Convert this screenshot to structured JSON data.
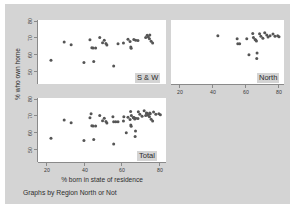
{
  "figure": {
    "caption": "Graphs by Region North or Not",
    "background_color": "#d4d4d4",
    "panel_background_color": "#ffffff",
    "marker_color": "#555555"
  },
  "axes": {
    "ylabel": "% who own home",
    "xlabel": "% born in state of residence",
    "yticks": [
      "80",
      "70",
      "60",
      "50"
    ],
    "xticks": [
      "20",
      "40",
      "60",
      "80"
    ],
    "ylim": [
      46,
      82
    ],
    "xlim": [
      17,
      85
    ]
  },
  "chart_data": {
    "type": "scatter",
    "title": "",
    "xlabel": "% born in state of residence",
    "ylabel": "% who own home",
    "xlim": [
      17,
      85
    ],
    "ylim": [
      46,
      82
    ],
    "xticks": [
      20,
      40,
      60,
      80
    ],
    "yticks": [
      50,
      60,
      70,
      80
    ],
    "grid": false,
    "legend": "panel-corner-labels",
    "panels": [
      {
        "name": "S & W",
        "label": "S & W",
        "position": "top-left",
        "x_axis_labels_shown": false,
        "y_axis_labels_shown": true,
        "points": [
          {
            "x": 23.9,
            "y": 59.3
          },
          {
            "x": 30.9,
            "y": 69.6
          },
          {
            "x": 34.6,
            "y": 68.1
          },
          {
            "x": 41.4,
            "y": 58.1
          },
          {
            "x": 44.6,
            "y": 70.9
          },
          {
            "x": 45.6,
            "y": 66.4
          },
          {
            "x": 46.3,
            "y": 66.2
          },
          {
            "x": 46.6,
            "y": 58.6
          },
          {
            "x": 47.6,
            "y": 66.3
          },
          {
            "x": 49.8,
            "y": 72.2
          },
          {
            "x": 51.3,
            "y": 69.2
          },
          {
            "x": 52.2,
            "y": 70.6
          },
          {
            "x": 53.1,
            "y": 68.8
          },
          {
            "x": 53.6,
            "y": 68.0
          },
          {
            "x": 57.2,
            "y": 56.1
          },
          {
            "x": 59.5,
            "y": 68.6
          },
          {
            "x": 62.4,
            "y": 69.0
          },
          {
            "x": 64.8,
            "y": 71.2
          },
          {
            "x": 65.9,
            "y": 69.9
          },
          {
            "x": 66.3,
            "y": 66.8
          },
          {
            "x": 66.5,
            "y": 66.1
          },
          {
            "x": 67.9,
            "y": 71.1
          },
          {
            "x": 68.9,
            "y": 70.6
          },
          {
            "x": 70.1,
            "y": 70.4
          },
          {
            "x": 74.2,
            "y": 72.1
          },
          {
            "x": 75.0,
            "y": 73.4
          },
          {
            "x": 75.6,
            "y": 72.5
          },
          {
            "x": 76.2,
            "y": 71.5
          },
          {
            "x": 76.4,
            "y": 73.6
          },
          {
            "x": 77.1,
            "y": 70.0
          },
          {
            "x": 77.9,
            "y": 69.0
          }
        ]
      },
      {
        "name": "North",
        "label": "North",
        "position": "top-right",
        "x_axis_labels_shown": true,
        "y_axis_labels_shown": false,
        "points": [
          {
            "x": 45.2,
            "y": 73.1
          },
          {
            "x": 56.8,
            "y": 71.4
          },
          {
            "x": 57.2,
            "y": 68.7
          },
          {
            "x": 58.3,
            "y": 68.6
          },
          {
            "x": 62.6,
            "y": 71.5
          },
          {
            "x": 63.9,
            "y": 62.5
          },
          {
            "x": 66.2,
            "y": 74.4
          },
          {
            "x": 66.6,
            "y": 72.2
          },
          {
            "x": 67.6,
            "y": 71.0
          },
          {
            "x": 68.0,
            "y": 70.8
          },
          {
            "x": 68.4,
            "y": 70.2
          },
          {
            "x": 68.6,
            "y": 60.4
          },
          {
            "x": 68.8,
            "y": 63.4
          },
          {
            "x": 70.3,
            "y": 74.2
          },
          {
            "x": 71.1,
            "y": 72.8
          },
          {
            "x": 72.3,
            "y": 71.8
          },
          {
            "x": 73.4,
            "y": 74.8
          },
          {
            "x": 74.6,
            "y": 73.6
          },
          {
            "x": 75.4,
            "y": 72.4
          },
          {
            "x": 76.6,
            "y": 73.2
          },
          {
            "x": 78.4,
            "y": 74.1
          },
          {
            "x": 79.6,
            "y": 72.8
          },
          {
            "x": 81.2,
            "y": 73.2
          },
          {
            "x": 82.0,
            "y": 72.6
          }
        ]
      },
      {
        "name": "Total",
        "label": "Total",
        "position": "bottom-left",
        "x_axis_labels_shown": true,
        "y_axis_labels_shown": true,
        "points": [
          {
            "x": 23.9,
            "y": 59.3
          },
          {
            "x": 30.9,
            "y": 69.6
          },
          {
            "x": 34.6,
            "y": 68.1
          },
          {
            "x": 41.4,
            "y": 58.1
          },
          {
            "x": 44.6,
            "y": 70.9
          },
          {
            "x": 45.2,
            "y": 73.1
          },
          {
            "x": 45.6,
            "y": 66.4
          },
          {
            "x": 46.3,
            "y": 66.2
          },
          {
            "x": 46.6,
            "y": 58.6
          },
          {
            "x": 47.6,
            "y": 66.3
          },
          {
            "x": 49.8,
            "y": 72.2
          },
          {
            "x": 51.3,
            "y": 69.2
          },
          {
            "x": 52.2,
            "y": 70.6
          },
          {
            "x": 53.1,
            "y": 68.8
          },
          {
            "x": 53.6,
            "y": 68.0
          },
          {
            "x": 56.8,
            "y": 71.4
          },
          {
            "x": 57.2,
            "y": 56.1
          },
          {
            "x": 57.2,
            "y": 68.7
          },
          {
            "x": 58.3,
            "y": 68.6
          },
          {
            "x": 59.5,
            "y": 68.6
          },
          {
            "x": 62.4,
            "y": 69.0
          },
          {
            "x": 62.6,
            "y": 71.5
          },
          {
            "x": 63.9,
            "y": 62.5
          },
          {
            "x": 64.8,
            "y": 71.2
          },
          {
            "x": 65.9,
            "y": 69.9
          },
          {
            "x": 66.2,
            "y": 74.4
          },
          {
            "x": 66.3,
            "y": 66.8
          },
          {
            "x": 66.5,
            "y": 66.1
          },
          {
            "x": 66.6,
            "y": 72.2
          },
          {
            "x": 67.6,
            "y": 71.0
          },
          {
            "x": 67.9,
            "y": 71.1
          },
          {
            "x": 68.0,
            "y": 70.8
          },
          {
            "x": 68.4,
            "y": 70.2
          },
          {
            "x": 68.6,
            "y": 60.4
          },
          {
            "x": 68.8,
            "y": 63.4
          },
          {
            "x": 68.9,
            "y": 70.6
          },
          {
            "x": 70.1,
            "y": 70.4
          },
          {
            "x": 70.3,
            "y": 74.2
          },
          {
            "x": 71.1,
            "y": 72.8
          },
          {
            "x": 72.3,
            "y": 71.8
          },
          {
            "x": 73.4,
            "y": 74.8
          },
          {
            "x": 74.2,
            "y": 72.1
          },
          {
            "x": 74.6,
            "y": 73.6
          },
          {
            "x": 75.0,
            "y": 73.4
          },
          {
            "x": 75.4,
            "y": 72.4
          },
          {
            "x": 75.6,
            "y": 72.5
          },
          {
            "x": 76.2,
            "y": 71.5
          },
          {
            "x": 76.4,
            "y": 73.6
          },
          {
            "x": 76.6,
            "y": 73.2
          },
          {
            "x": 77.1,
            "y": 70.0
          },
          {
            "x": 77.9,
            "y": 69.0
          },
          {
            "x": 78.4,
            "y": 74.1
          },
          {
            "x": 79.6,
            "y": 72.8
          },
          {
            "x": 81.2,
            "y": 73.2
          },
          {
            "x": 82.0,
            "y": 72.6
          }
        ]
      }
    ]
  }
}
